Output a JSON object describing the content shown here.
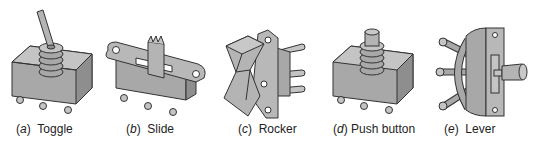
{
  "figure": {
    "colors": {
      "fill": "#a8a8a8",
      "fill_light": "#c4c4c4",
      "fill_dark": "#8e8e8e",
      "stroke": "#333333"
    },
    "panels": [
      {
        "letter": "a",
        "label": "Toggle"
      },
      {
        "letter": "b",
        "label": "Slide"
      },
      {
        "letter": "c",
        "label": "Rocker"
      },
      {
        "letter": "d",
        "label": "Push button"
      },
      {
        "letter": "e",
        "label": "Lever"
      }
    ]
  }
}
